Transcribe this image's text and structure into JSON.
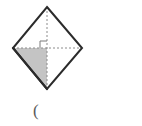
{
  "figure": {
    "name": "rhombus-with-shaded-quadrant",
    "background_color": "#ffffff",
    "outline_color": "#2b2b2b",
    "outline_width": 2,
    "diagonal_color": "#8c8c8c",
    "diagonal_width": 1,
    "diagonal_dash": "2,2",
    "shading_color": "#c4c4c4",
    "shading_edge_color": "#2b2b2b",
    "vertices": {
      "top": {
        "label": "top-vertex",
        "x": 47,
        "y": 7
      },
      "right": {
        "label": "right-vertex",
        "x": 82,
        "y": 48
      },
      "bottom": {
        "label": "bottom-vertex",
        "x": 47,
        "y": 89
      },
      "left": {
        "label": "left-vertex",
        "x": 13,
        "y": 48
      }
    },
    "center": {
      "label": "diagonal-intersection",
      "x": 47,
      "y": 48
    },
    "diagonals": [
      {
        "name": "vertical-diagonal",
        "from": "top",
        "to": "bottom",
        "style": "dashed"
      },
      {
        "name": "horizontal-diagonal",
        "from": "left",
        "to": "right",
        "style": "dashed"
      }
    ],
    "right_angle_marker": {
      "name": "right-angle-marker",
      "quadrant": "upper-left",
      "size": 7,
      "color": "#7a7a7a"
    },
    "shaded_region": {
      "name": "shaded-triangle",
      "quadrant": "lower-left",
      "points": "13,48 47,48 47,89"
    }
  },
  "caption": {
    "text": "("
  }
}
